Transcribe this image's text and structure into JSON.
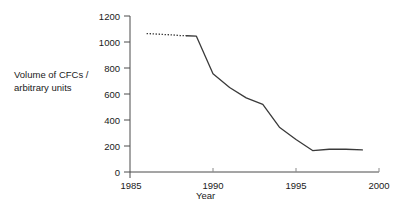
{
  "chart_data": {
    "type": "line",
    "title": "",
    "xlabel": "Year",
    "ylabel": "Volume of CFCs /\narbitrary units",
    "ylabel_line1": "Volume of CFCs /",
    "ylabel_line2": "arbitrary units",
    "xlim": [
      1985,
      2000
    ],
    "ylim": [
      0,
      1200
    ],
    "xticks": [
      1985,
      1990,
      1995,
      2000
    ],
    "xticklabels": [
      "1985",
      "1990",
      "1995",
      "2000"
    ],
    "yticks": [
      0,
      200,
      400,
      600,
      800,
      1000,
      1200
    ],
    "yticklabels": [
      "0",
      "200",
      "400",
      "600",
      "800",
      "1000",
      "1200"
    ],
    "grid": false,
    "legend": null,
    "line_color": "#3a3a3a",
    "series": [
      {
        "name": "Volume of CFCs",
        "style": "dotted",
        "comment": "estimated / projected early segment",
        "x": [
          1986.0,
          1986.5,
          1987.0,
          1987.5,
          1988.0,
          1988.4
        ],
        "values": [
          1065,
          1062,
          1058,
          1055,
          1050,
          1048
        ]
      },
      {
        "name": "Volume of CFCs",
        "style": "solid",
        "comment": "measured data",
        "x": [
          1988.4,
          1989.0,
          1990.0,
          1991.0,
          1992.0,
          1993.0,
          1994.0,
          1995.0,
          1996.0,
          1997.0,
          1998.0,
          1999.0
        ],
        "values": [
          1048,
          1045,
          755,
          650,
          570,
          520,
          345,
          250,
          165,
          175,
          175,
          170
        ]
      }
    ]
  },
  "axes": {
    "x_axis_name": "year-axis",
    "y_axis_name": "volume-axis"
  }
}
